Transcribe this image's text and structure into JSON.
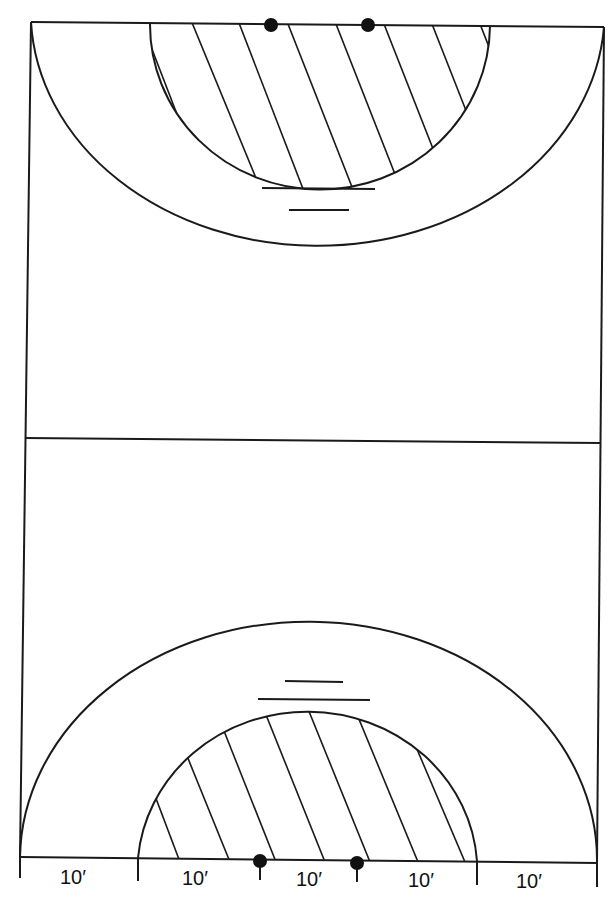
{
  "diagram": {
    "title": "",
    "court_lines_color": "#1a1a1a",
    "background": "#ffffff",
    "markers": {
      "top_goal_posts": [
        {
          "x": 271,
          "y": 25
        },
        {
          "x": 368,
          "y": 25
        }
      ],
      "bottom_goal_posts": [
        {
          "x": 260,
          "y": 861
        },
        {
          "x": 357,
          "y": 863
        }
      ]
    },
    "dimension_labels": [
      "10′",
      "10′",
      "10′",
      "10′",
      "10′"
    ]
  }
}
